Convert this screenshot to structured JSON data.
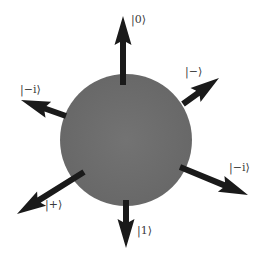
{
  "diagram": {
    "title": "",
    "sphere": {
      "cx": 126,
      "cy": 140,
      "r": 66,
      "fill": "#6e6e6e"
    },
    "arrow_color": "#1a1a1a",
    "arrows": [
      {
        "id": "zero",
        "label": "|0⟩",
        "tail": [
          123,
          85
        ],
        "tip": [
          123,
          16
        ],
        "label_pos": [
          131,
          14
        ]
      },
      {
        "id": "minus",
        "label": "|−⟩",
        "tail": [
          183,
          104
        ],
        "tip": [
          219,
          78
        ],
        "label_pos": [
          185,
          66
        ]
      },
      {
        "id": "minus-i-l",
        "label": "|−i⟩",
        "tail": [
          66,
          116
        ],
        "tip": [
          21,
          100
        ],
        "label_pos": [
          20,
          84
        ]
      },
      {
        "id": "minus-i-r",
        "label": "|−i⟩",
        "tail": [
          180,
          167
        ],
        "tip": [
          248,
          195
        ],
        "label_pos": [
          229,
          162
        ]
      },
      {
        "id": "plus",
        "label": "|+⟩",
        "tail": [
          84,
          172
        ],
        "tip": [
          17,
          214
        ],
        "label_pos": [
          45,
          199
        ]
      },
      {
        "id": "one",
        "label": "|1⟩",
        "tail": [
          126,
          200
        ],
        "tip": [
          126,
          248
        ],
        "label_pos": [
          137,
          225
        ]
      }
    ]
  }
}
